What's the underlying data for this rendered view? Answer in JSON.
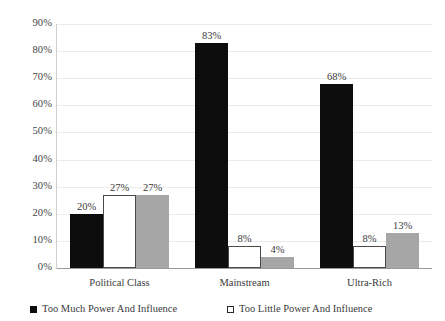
{
  "chart_data": {
    "type": "bar",
    "title": "",
    "xlabel": "",
    "ylabel": "",
    "categories": [
      "Political Class",
      "Mainstream",
      "Ultra-Rich"
    ],
    "series": [
      {
        "name": "Too Much Power And Influence",
        "color": "#0d0d0d",
        "marker": "filled-square",
        "values": [
          20,
          27,
          68
        ],
        "labels": [
          "20%",
          "83%",
          "68%"
        ]
      },
      {
        "name": "Too Little Power And Influence",
        "color": "#ffffff",
        "marker": "hollow-square",
        "values": [
          27,
          8,
          8
        ],
        "labels": [
          "27%",
          "8%",
          "8%"
        ]
      },
      {
        "name": "",
        "color": "#a6a6a6",
        "marker": "gray-square",
        "values": [
          27,
          4,
          13
        ],
        "labels": [
          "27%",
          "4%",
          "13%"
        ]
      }
    ],
    "groups": [
      {
        "category": "Political Class",
        "bars": [
          {
            "series": 0,
            "value": 20,
            "label": "20%"
          },
          {
            "series": 1,
            "value": 27,
            "label": "27%"
          },
          {
            "series": 2,
            "value": 27,
            "label": "27%"
          }
        ]
      },
      {
        "category": "Mainstream",
        "bars": [
          {
            "series": 0,
            "value": 83,
            "label": "83%"
          },
          {
            "series": 1,
            "value": 8,
            "label": "8%"
          },
          {
            "series": 2,
            "value": 4,
            "label": "4%"
          }
        ]
      },
      {
        "category": "Ultra-Rich",
        "bars": [
          {
            "series": 0,
            "value": 68,
            "label": "68%"
          },
          {
            "series": 1,
            "value": 8,
            "label": "8%"
          },
          {
            "series": 2,
            "value": 13,
            "label": "13%"
          }
        ]
      }
    ],
    "ylim": [
      0,
      90
    ],
    "ytick_values": [
      0,
      10,
      20,
      30,
      40,
      50,
      60,
      70,
      80,
      90
    ],
    "ytick_labels": [
      "0%",
      "10%",
      "20%",
      "30%",
      "40%",
      "50%",
      "60%",
      "70%",
      "80%",
      "90%"
    ],
    "grid": true,
    "grid_color": "#ebebeb",
    "legend_position": "bottom",
    "legend": [
      {
        "label": "Too Much Power And Influence",
        "marker": "filled-square"
      },
      {
        "label": "Too Little Power And Influence",
        "marker": "hollow-square"
      }
    ]
  }
}
